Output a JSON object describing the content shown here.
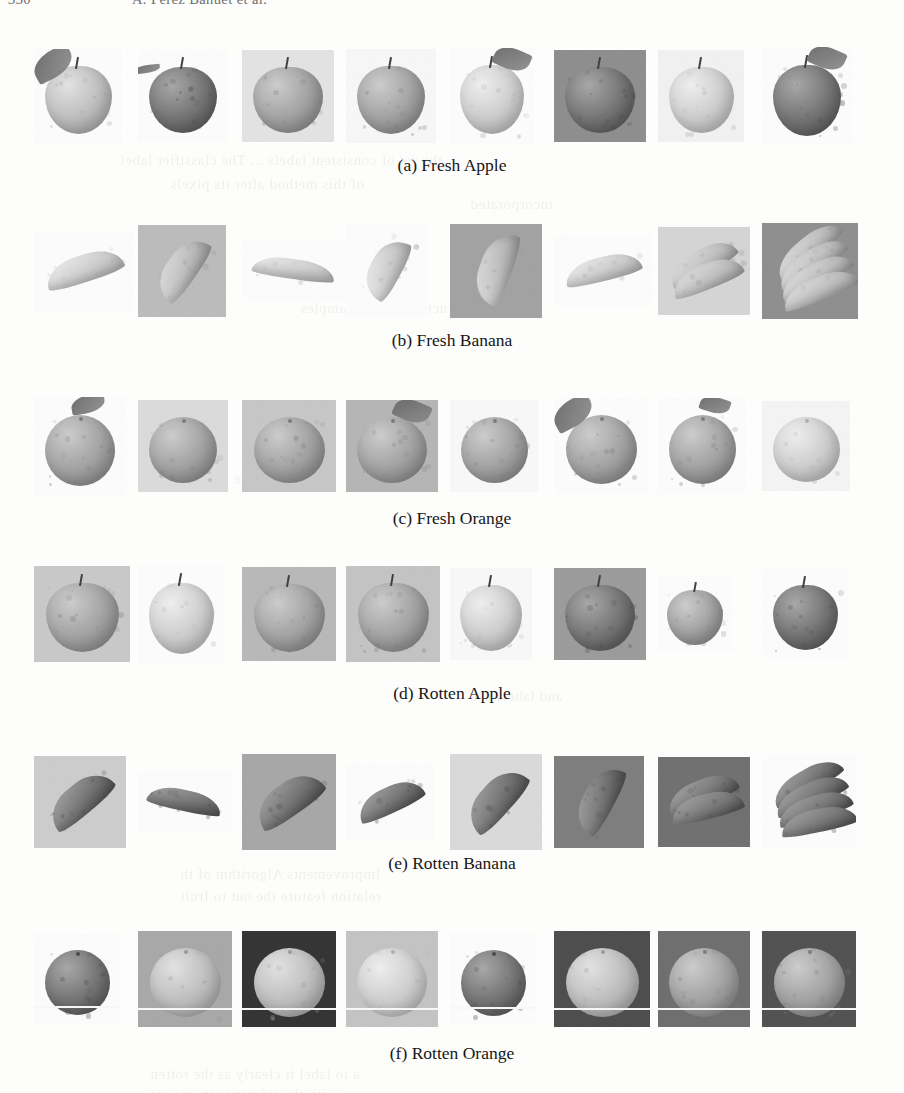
{
  "page": {
    "width": 904,
    "height": 1093,
    "background": "#fdfdfc",
    "running_head": {
      "folio": "330",
      "authors": "A. Perez Banuet et al."
    },
    "bleed_through_visible": true
  },
  "figure": {
    "rows": [
      {
        "id": "a",
        "caption": "(a) Fresh Apple",
        "label": "Fresh Apple",
        "class_name": "fresh-apple",
        "count": 8,
        "top": 42,
        "caption_top": 155,
        "items": [
          {
            "name": "apple-with-leaf-light",
            "w": 88,
            "h": 95,
            "x": 0,
            "bg": "#ffffff",
            "tone": "light",
            "shape": "apple",
            "leaf": "left",
            "boxed": false
          },
          {
            "name": "apple-dark-glossy",
            "w": 90,
            "h": 92,
            "x": 104,
            "bg": "#ffffff",
            "tone": "dark",
            "shape": "apple",
            "leaf": "stem-left",
            "boxed": false
          },
          {
            "name": "apple-front-boxed",
            "w": 92,
            "h": 92,
            "x": 208,
            "bg": "#e7e5e0",
            "tone": "mid",
            "shape": "apple",
            "leaf": "none",
            "boxed": true
          },
          {
            "name": "apple-round-grey",
            "w": 90,
            "h": 94,
            "x": 312,
            "bg": "#fafafa",
            "tone": "mid",
            "shape": "apple",
            "leaf": "none",
            "boxed": false
          },
          {
            "name": "apple-pale-leaf",
            "w": 84,
            "h": 96,
            "x": 416,
            "bg": "#ffffff",
            "tone": "pale",
            "shape": "apple",
            "leaf": "right",
            "boxed": false
          },
          {
            "name": "apple-top-view-boxed",
            "w": 92,
            "h": 92,
            "x": 520,
            "bg": "#8e8c88",
            "tone": "dark",
            "shape": "apple-top",
            "leaf": "none",
            "boxed": true
          },
          {
            "name": "apple-soft-pale",
            "w": 86,
            "h": 92,
            "x": 624,
            "bg": "#f4f3f1",
            "tone": "pale",
            "shape": "apple",
            "leaf": "none",
            "boxed": false
          },
          {
            "name": "apple-dark-with-leaf",
            "w": 90,
            "h": 98,
            "x": 728,
            "bg": "#ffffff",
            "tone": "dark",
            "shape": "apple",
            "leaf": "right",
            "boxed": false
          }
        ]
      },
      {
        "id": "b",
        "caption": "(b) Fresh Banana",
        "label": "Fresh Banana",
        "class_name": "fresh-banana",
        "count": 8,
        "top": 217,
        "caption_top": 330,
        "items": [
          {
            "name": "banana-curve-right",
            "w": 100,
            "h": 80,
            "x": 0,
            "bg": "#ffffff",
            "tone": "pale",
            "shape": "banana",
            "rot": -18,
            "boxed": false
          },
          {
            "name": "banana-boxed-grey",
            "w": 88,
            "h": 92,
            "x": 104,
            "bg": "#bdbbb6",
            "tone": "light",
            "shape": "banana",
            "rot": -55,
            "boxed": true
          },
          {
            "name": "banana-horizontal",
            "w": 104,
            "h": 60,
            "x": 208,
            "bg": "#ffffff",
            "tone": "pale",
            "shape": "banana",
            "rot": 8,
            "boxed": false
          },
          {
            "name": "banana-diagonal",
            "w": 80,
            "h": 92,
            "x": 312,
            "bg": "#ffffff",
            "tone": "pale",
            "shape": "banana",
            "rot": -62,
            "boxed": false
          },
          {
            "name": "banana-boxed-dark",
            "w": 92,
            "h": 94,
            "x": 416,
            "bg": "#a3a19c",
            "tone": "light",
            "shape": "banana",
            "rot": -70,
            "boxed": true
          },
          {
            "name": "banana-bright",
            "w": 98,
            "h": 70,
            "x": 520,
            "bg": "#ffffff",
            "tone": "pale",
            "shape": "banana",
            "rot": -14,
            "boxed": false
          },
          {
            "name": "banana-pair-boxed",
            "w": 92,
            "h": 88,
            "x": 624,
            "bg": "#d8d6d1",
            "tone": "light",
            "shape": "banana-pair",
            "rot": -30,
            "boxed": true
          },
          {
            "name": "banana-bunch-boxed",
            "w": 96,
            "h": 96,
            "x": 728,
            "bg": "#8f8d88",
            "tone": "light",
            "shape": "banana-bunch",
            "rot": -40,
            "boxed": true
          }
        ]
      },
      {
        "id": "c",
        "caption": "(c) Fresh Orange",
        "label": "Fresh Orange",
        "class_name": "fresh-orange",
        "count": 8,
        "top": 392,
        "caption_top": 508,
        "items": [
          {
            "name": "orange-with-leaf",
            "w": 92,
            "h": 98,
            "x": 0,
            "bg": "#ffffff",
            "tone": "mid",
            "shape": "orange",
            "leaf": "top",
            "boxed": false
          },
          {
            "name": "orange-boxed-soft",
            "w": 90,
            "h": 92,
            "x": 104,
            "bg": "#dedcd7",
            "tone": "mid",
            "shape": "orange",
            "leaf": "none",
            "boxed": true
          },
          {
            "name": "orange-boxed-large",
            "w": 94,
            "h": 92,
            "x": 208,
            "bg": "#c9c7c2",
            "tone": "mid",
            "shape": "orange",
            "leaf": "none",
            "boxed": true
          },
          {
            "name": "orange-boxed-leafy",
            "w": 92,
            "h": 92,
            "x": 312,
            "bg": "#b7b5b0",
            "tone": "mid",
            "shape": "orange",
            "leaf": "right",
            "boxed": true
          },
          {
            "name": "orange-plain-round",
            "w": 88,
            "h": 92,
            "x": 416,
            "bg": "#fbfbfa",
            "tone": "mid",
            "shape": "orange",
            "leaf": "none",
            "boxed": false
          },
          {
            "name": "orange-with-big-leaf",
            "w": 94,
            "h": 96,
            "x": 520,
            "bg": "#ffffff",
            "tone": "mid",
            "shape": "orange",
            "leaf": "left",
            "boxed": false
          },
          {
            "name": "orange-stem-leaf",
            "w": 88,
            "h": 96,
            "x": 624,
            "bg": "#ffffff",
            "tone": "mid",
            "shape": "orange",
            "leaf": "topright",
            "boxed": false
          },
          {
            "name": "orange-pale-round",
            "w": 88,
            "h": 90,
            "x": 728,
            "bg": "#f7f6f4",
            "tone": "pale",
            "shape": "orange",
            "leaf": "none",
            "boxed": false
          }
        ]
      },
      {
        "id": "d",
        "caption": "(d) Rotten Apple",
        "label": "Rotten Apple",
        "class_name": "rotten-apple",
        "count": 8,
        "top": 560,
        "caption_top": 683,
        "items": [
          {
            "name": "rotten-apple-boxed-table",
            "w": 96,
            "h": 96,
            "x": 0,
            "bg": "#cbc9c4",
            "tone": "mid",
            "shape": "apple",
            "boxed": true
          },
          {
            "name": "rotten-apple-stemmed",
            "w": 86,
            "h": 98,
            "x": 104,
            "bg": "#ffffff",
            "tone": "pale",
            "shape": "apple",
            "boxed": false
          },
          {
            "name": "rotten-apple-boxed-rough",
            "w": 94,
            "h": 94,
            "x": 208,
            "bg": "#bab8b3",
            "tone": "mid",
            "shape": "apple",
            "boxed": true
          },
          {
            "name": "rotten-apple-boxed-spotted",
            "w": 94,
            "h": 96,
            "x": 312,
            "bg": "#c6c4bf",
            "tone": "mid",
            "shape": "apple",
            "boxed": true
          },
          {
            "name": "rotten-apple-wrinkled",
            "w": 82,
            "h": 92,
            "x": 416,
            "bg": "#fbfbfa",
            "tone": "pale",
            "shape": "apple",
            "boxed": false
          },
          {
            "name": "rotten-apple-boxed-top",
            "w": 92,
            "h": 92,
            "x": 520,
            "bg": "#9c9a95",
            "tone": "dark",
            "shape": "apple-top",
            "boxed": true
          },
          {
            "name": "rotten-apple-shrivelled",
            "w": 74,
            "h": 76,
            "x": 624,
            "bg": "#ffffff",
            "tone": "mid",
            "shape": "apple",
            "boxed": false
          },
          {
            "name": "rotten-apple-dark-round",
            "w": 86,
            "h": 90,
            "x": 728,
            "bg": "#ffffff",
            "tone": "dark",
            "shape": "apple",
            "boxed": false
          }
        ]
      },
      {
        "id": "e",
        "caption": "(e) Rotten Banana",
        "label": "Rotten Banana",
        "class_name": "rotten-banana",
        "count": 8,
        "top": 748,
        "caption_top": 853,
        "items": [
          {
            "name": "rotten-banana-boxed-dark",
            "w": 92,
            "h": 92,
            "x": 0,
            "bg": "#cfcdc8",
            "tone": "dark",
            "shape": "banana",
            "rot": -40,
            "boxed": true
          },
          {
            "name": "rotten-banana-curved",
            "w": 94,
            "h": 62,
            "x": 104,
            "bg": "#ffffff",
            "tone": "dark",
            "shape": "banana",
            "rot": 12,
            "boxed": false
          },
          {
            "name": "rotten-banana-boxed-wood",
            "w": 94,
            "h": 96,
            "x": 208,
            "bg": "#a8a6a1",
            "tone": "dark",
            "shape": "banana",
            "rot": -35,
            "boxed": true
          },
          {
            "name": "rotten-banana-single",
            "w": 88,
            "h": 76,
            "x": 312,
            "bg": "#ffffff",
            "tone": "dark",
            "shape": "banana",
            "rot": -25,
            "boxed": false
          },
          {
            "name": "rotten-banana-boxed-light",
            "w": 92,
            "h": 96,
            "x": 416,
            "bg": "#dddbd6",
            "tone": "dark",
            "shape": "banana",
            "rot": -48,
            "boxed": true
          },
          {
            "name": "rotten-banana-boxed-black",
            "w": 90,
            "h": 92,
            "x": 520,
            "bg": "#7d7b77",
            "tone": "dark",
            "shape": "banana",
            "rot": -62,
            "boxed": true
          },
          {
            "name": "rotten-banana-boxed-pair",
            "w": 92,
            "h": 90,
            "x": 624,
            "bg": "#6f6d69",
            "tone": "dark",
            "shape": "banana-pair",
            "rot": -22,
            "boxed": true
          },
          {
            "name": "rotten-banana-bunch",
            "w": 94,
            "h": 94,
            "x": 728,
            "bg": "#ffffff",
            "tone": "dark",
            "shape": "banana-bunch",
            "rot": -30,
            "boxed": false
          }
        ]
      },
      {
        "id": "f",
        "caption": "(f) Rotten Orange",
        "label": "Rotten Orange",
        "class_name": "rotten-orange",
        "count": 8,
        "top": 925,
        "caption_top": 1043,
        "items": [
          {
            "name": "rotten-orange-plain",
            "w": 86,
            "h": 90,
            "x": 0,
            "bg": "#ffffff",
            "tone": "dark",
            "shape": "orange",
            "boxed": false,
            "baseline": true
          },
          {
            "name": "rotten-orange-boxed-bright",
            "w": 94,
            "h": 96,
            "x": 104,
            "bg": "#a9a7a2",
            "tone": "light",
            "shape": "orange",
            "boxed": true,
            "baseline": true
          },
          {
            "name": "rotten-orange-boxed-black",
            "w": 94,
            "h": 96,
            "x": 208,
            "bg": "#2f2e2c",
            "tone": "light",
            "shape": "orange",
            "boxed": true,
            "baseline": true
          },
          {
            "name": "rotten-orange-boxed-pale",
            "w": 92,
            "h": 96,
            "x": 312,
            "bg": "#c6c4bf",
            "tone": "pale",
            "shape": "orange",
            "boxed": true,
            "baseline": true
          },
          {
            "name": "rotten-orange-dark",
            "w": 86,
            "h": 92,
            "x": 416,
            "bg": "#ffffff",
            "tone": "dark",
            "shape": "orange",
            "boxed": false,
            "baseline": true
          },
          {
            "name": "rotten-orange-boxed-lit",
            "w": 96,
            "h": 96,
            "x": 520,
            "bg": "#4a4947",
            "tone": "light",
            "shape": "orange",
            "boxed": true,
            "baseline": true
          },
          {
            "name": "rotten-orange-boxed-mid",
            "w": 92,
            "h": 96,
            "x": 624,
            "bg": "#6d6b67",
            "tone": "mid",
            "shape": "orange",
            "boxed": true,
            "baseline": true
          },
          {
            "name": "rotten-orange-boxed-split",
            "w": 94,
            "h": 96,
            "x": 728,
            "bg": "#4f4e4b",
            "tone": "mid",
            "shape": "orange",
            "boxed": true,
            "baseline": true
          }
        ]
      }
    ]
  },
  "bleed_text": [
    {
      "t": "the set of consistent labels ... The classifier label",
      "x": 120,
      "y": 152
    },
    {
      "t": "of this method after its pixels",
      "x": 170,
      "y": 176
    },
    {
      "t": "incorporated",
      "x": 470,
      "y": 196
    },
    {
      "t": "constructed for new samples",
      "x": 300,
      "y": 300
    },
    {
      "t": "each the of detection",
      "x": 150,
      "y": 470
    },
    {
      "t": "and labels use",
      "x": 470,
      "y": 688
    },
    {
      "t": "Improvements  Algorithm  of  th",
      "x": 180,
      "y": 866
    },
    {
      "t": "relation feature  the  out  to  fruit",
      "x": 180,
      "y": 888
    },
    {
      "t": "a  to  label  it  clearly  as  the  rotten",
      "x": 150,
      "y": 1066
    },
    {
      "t": "with the  reference  in  one  set",
      "x": 150,
      "y": 1086
    }
  ]
}
